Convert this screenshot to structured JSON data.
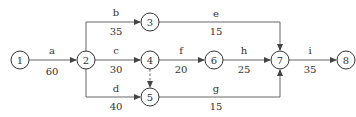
{
  "nodes": [
    {
      "id": "1",
      "x": 20,
      "y": 60
    },
    {
      "id": "2",
      "x": 86,
      "y": 60
    },
    {
      "id": "3",
      "x": 150,
      "y": 22
    },
    {
      "id": "4",
      "x": 150,
      "y": 60
    },
    {
      "id": "5",
      "x": 150,
      "y": 97
    },
    {
      "id": "6",
      "x": 214,
      "y": 60
    },
    {
      "id": "7",
      "x": 280,
      "y": 60
    },
    {
      "id": "8",
      "x": 346,
      "y": 60
    }
  ],
  "activities": [
    {
      "name": "a",
      "duration": "60",
      "from": "1",
      "to": "2"
    },
    {
      "name": "b",
      "duration": "35",
      "from": "2",
      "to": "3"
    },
    {
      "name": "c",
      "duration": "30",
      "from": "2",
      "to": "4"
    },
    {
      "name": "d",
      "duration": "40",
      "from": "2",
      "to": "5"
    },
    {
      "name": "e",
      "duration": "15",
      "from": "3",
      "to": "7"
    },
    {
      "name": "f",
      "duration": "20",
      "from": "4",
      "to": "6"
    },
    {
      "name": "g",
      "duration": "15",
      "from": "5",
      "to": "7"
    },
    {
      "name": "h",
      "duration": "25",
      "from": "6",
      "to": "7"
    },
    {
      "name": "i",
      "duration": "35",
      "from": "7",
      "to": "8"
    }
  ],
  "dummy_activities": [
    {
      "from": "4",
      "to": "5"
    }
  ]
}
